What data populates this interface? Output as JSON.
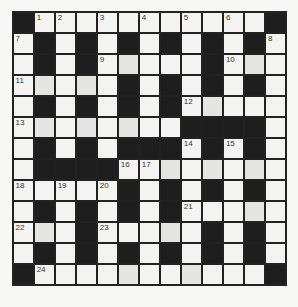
{
  "puzzle": {
    "type": "crossword",
    "rows": 13,
    "cols": 13,
    "colors": {
      "black": "#1e1e1e",
      "white": "#f3f3f1",
      "grid_line": "#222222"
    },
    "layout": [
      "#.............#",
      "x"
    ],
    "grid": [
      [
        "#",
        "1",
        "2",
        ".",
        "3",
        ".",
        "4",
        ".",
        "5",
        ".",
        "6",
        ".",
        "#"
      ],
      [
        "7",
        "#",
        ".",
        "#",
        ".",
        "#",
        ".",
        "#",
        ".",
        "#",
        ".",
        "#",
        "8"
      ],
      [
        ".",
        "#",
        ".",
        "#",
        "9",
        ".",
        ".",
        ".",
        ".",
        "#",
        "10",
        ".",
        "."
      ],
      [
        "11",
        ".",
        ".",
        ".",
        ".",
        "#",
        ".",
        "#",
        ".",
        "#",
        ".",
        "#",
        "."
      ],
      [
        ".",
        "#",
        ".",
        "#",
        ".",
        "#",
        ".",
        "#",
        "12",
        ".",
        ".",
        ".",
        "."
      ],
      [
        "13",
        ".",
        ".",
        ".",
        ".",
        ".",
        ".",
        ".",
        "#",
        "#",
        "#",
        "#",
        "."
      ],
      [
        ".",
        "#",
        ".",
        "#",
        ".",
        "#",
        "#",
        "#",
        "14",
        "#",
        "15",
        "#",
        "."
      ],
      [
        ".",
        "#",
        "#",
        "#",
        "#",
        "16",
        "17",
        ".",
        ".",
        ".",
        ".",
        ".",
        "."
      ],
      [
        "18",
        ".",
        "19",
        ".",
        "20",
        "#",
        ".",
        "#",
        ".",
        "#",
        ".",
        "#",
        "."
      ],
      [
        ".",
        "#",
        ".",
        "#",
        ".",
        "#",
        ".",
        "#",
        "21",
        ".",
        ".",
        ".",
        "."
      ],
      [
        "22",
        ".",
        ".",
        "#",
        "23",
        ".",
        ".",
        ".",
        ".",
        "#",
        ".",
        "#",
        "."
      ],
      [
        ".",
        "#",
        ".",
        "#",
        ".",
        "#",
        ".",
        "#",
        ".",
        "#",
        ".",
        "#",
        "."
      ],
      [
        "#",
        "24",
        ".",
        ".",
        ".",
        ".",
        ".",
        ".",
        ".",
        ".",
        ".",
        ".",
        "#"
      ]
    ],
    "clue_numbers": [
      "1",
      "2",
      "3",
      "4",
      "5",
      "6",
      "7",
      "8",
      "9",
      "10",
      "11",
      "12",
      "13",
      "14",
      "15",
      "16",
      "17",
      "18",
      "19",
      "20",
      "21",
      "22",
      "23",
      "24"
    ]
  }
}
